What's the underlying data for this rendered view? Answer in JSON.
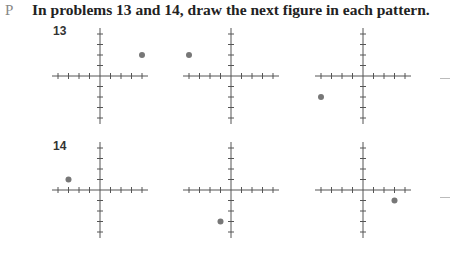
{
  "page_marker": "P",
  "instruction": "In problems 13 and 14, draw the next figure in each pattern.",
  "axes": {
    "tick_count_each_side": 4,
    "tick_spacing_px": 10.5,
    "axis_color": "#555555",
    "point_color": "#777777"
  },
  "problems": [
    {
      "number": "13",
      "figures": [
        {
          "point": [
            4,
            2
          ]
        },
        {
          "point": [
            -4,
            2
          ]
        },
        {
          "point": [
            -4,
            -2
          ]
        }
      ]
    },
    {
      "number": "14",
      "figures": [
        {
          "point": [
            -3,
            1
          ]
        },
        {
          "point": [
            -1,
            -3
          ]
        },
        {
          "point": [
            3,
            -1
          ]
        }
      ]
    }
  ]
}
